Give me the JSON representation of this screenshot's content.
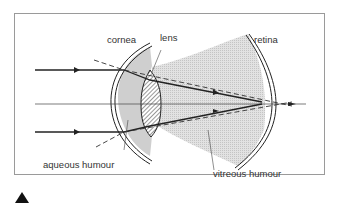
{
  "diagram": {
    "labels": {
      "cornea": "cornea",
      "lens": "lens",
      "retina": "retina",
      "aqueous_humour": "aqueous humour",
      "vitreous_humour": "vitreous humour"
    },
    "colors": {
      "frame": "#9a9a9a",
      "shade_light": "#dcdcdc",
      "shade_dark": "#c8c8c8",
      "line": "#222222",
      "text": "#333333"
    },
    "marker": "triangle-up-icon"
  }
}
